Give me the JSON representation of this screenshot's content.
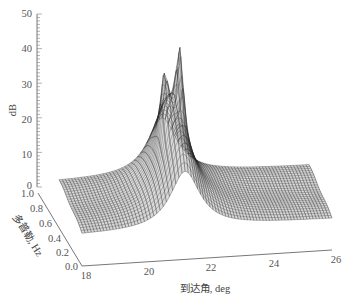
{
  "chart_data": {
    "type": "surface3d",
    "title": "",
    "xlabel": "到达角, deg",
    "ylabel": "多普勒, Hz",
    "zlabel": "dB",
    "x_ticks": [
      "18",
      "20",
      "22",
      "24",
      "26"
    ],
    "y_ticks": [
      "0.0",
      "0.2",
      "0.4",
      "0.6",
      "0.8",
      "1.0"
    ],
    "z_ticks": [
      "0",
      "10",
      "20",
      "30",
      "40",
      "50"
    ],
    "xlim": [
      18,
      26
    ],
    "ylim": [
      0.0,
      1.0
    ],
    "zlim": [
      0,
      50
    ],
    "grid": false,
    "legend": null,
    "surface": {
      "description": "Mesh surface with a sharp ridge peak near 21.3 deg arrival angle; flat baseline ~8-10 dB elsewhere",
      "baseline_db": 9,
      "peak_arrival_deg": 21.3,
      "peaks": [
        {
          "arrival_deg": 21.0,
          "doppler_hz": 0.5,
          "db": 38
        },
        {
          "arrival_deg": 21.5,
          "doppler_hz": 0.5,
          "db": 45
        }
      ],
      "ridge_db_at_edges": 18
    }
  },
  "axes": {
    "z_label": "dB",
    "x_label": "到达角, deg",
    "y_label": "多普勒, Hz"
  }
}
